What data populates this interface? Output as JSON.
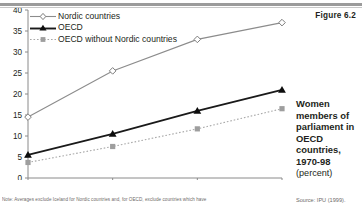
{
  "figure": {
    "number_label": "Figure 6.2",
    "caption_lines": [
      "Women",
      "members of",
      "parliament in",
      "OECD",
      "countries,",
      "1970-98"
    ],
    "units_label": "(percent)",
    "source": "Source: IPU (1999).",
    "note": "Note: Averages exclude Iceland for Nordic countries and, for OECD, exclude countries which have"
  },
  "chart_data": {
    "type": "line",
    "title": "Women members of parliament in OECD countries, 1970-98",
    "xlabel": "",
    "ylabel": "(percent)",
    "categories": [
      "1970",
      "1980",
      "1990",
      "Last elections"
    ],
    "x_tick_labels": [
      "1970",
      "1980",
      "1990",
      "Last elections"
    ],
    "y_tick_labels": [
      "0",
      "5",
      "10",
      "15",
      "20",
      "25",
      "30",
      "35",
      "40"
    ],
    "y_ticks": [
      0,
      5,
      10,
      15,
      20,
      25,
      30,
      35,
      40
    ],
    "ylim": [
      0,
      40
    ],
    "grid": false,
    "legend_position": "top-left",
    "series": [
      {
        "name": "Nordic countries",
        "values": [
          14.5,
          25.5,
          33.0,
          37.0
        ],
        "marker": "diamond-open",
        "color": "#8c8c8c",
        "line_style": "solid"
      },
      {
        "name": "OECD",
        "values": [
          5.5,
          10.5,
          16.0,
          21.0
        ],
        "marker": "triangle-filled",
        "color": "#1a1a1a",
        "line_style": "solid"
      },
      {
        "name": "OECD without Nordic countries",
        "values": [
          3.7,
          7.5,
          11.7,
          16.5
        ],
        "marker": "square-filled",
        "color": "#a8a8a8",
        "line_style": "dotted"
      }
    ]
  },
  "colors": {
    "nordic": "#8c8c8c",
    "oecd": "#1a1a1a",
    "oecd_without_nordic": "#a8a8a8",
    "axis": "#8a8a8a",
    "text": "#231f20",
    "muted_text": "#6e6a69",
    "rule": "#9b9b9b"
  }
}
